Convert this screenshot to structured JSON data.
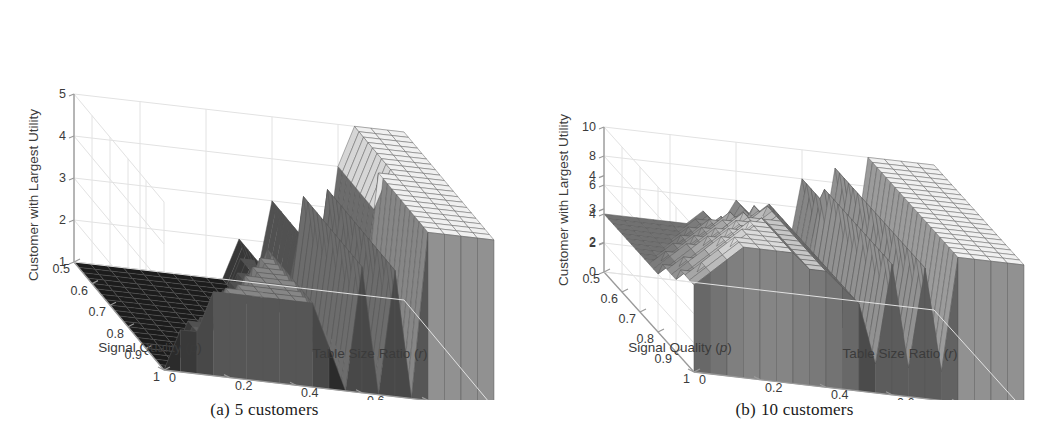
{
  "figure": {
    "background": "#ffffff",
    "panel_count": 2
  },
  "panels": [
    {
      "id": "panel-a",
      "caption_tag": "(a)",
      "caption_text": "5 customers",
      "chart_index": 0
    },
    {
      "id": "panel-b",
      "caption_tag": "(b)",
      "caption_text": "10 customers",
      "chart_index": 1
    }
  ],
  "chart_data": [
    {
      "type": "surface",
      "title": "",
      "subtitle": "(a) 5 customers",
      "xlabel": "Table Size Ratio (r)",
      "ylabel": "Signal Quality (p)",
      "zlabel": "Customer with Largest Utility",
      "xticks": [
        "1",
        "0.8",
        "0.6",
        "0.4",
        "0.2",
        "0"
      ],
      "xtick_values": [
        1,
        0.8,
        0.6,
        0.4,
        0.2,
        0
      ],
      "yticks": [
        "0.5",
        "0.6",
        "0.7",
        "0.8",
        "0.9",
        "1"
      ],
      "ytick_values": [
        0.5,
        0.6,
        0.7,
        0.8,
        0.9,
        1
      ],
      "zticks": [
        "1",
        "2",
        "3",
        "4",
        "5"
      ],
      "ztick_values": [
        1,
        2,
        3,
        4,
        5
      ],
      "xlim": [
        0,
        1
      ],
      "ylim": [
        0.5,
        1
      ],
      "zlim": [
        1,
        5
      ],
      "grid": true,
      "legend": "none",
      "colormap": "gray",
      "mesh": true,
      "n_customers": 5,
      "x": [
        1.0,
        0.95,
        0.9,
        0.85,
        0.8,
        0.75,
        0.7,
        0.65,
        0.6,
        0.55,
        0.5,
        0.45,
        0.4,
        0.35,
        0.3,
        0.25,
        0.2,
        0.15,
        0.1,
        0.05,
        0.0
      ],
      "y": [
        0.5,
        0.525,
        0.55,
        0.575,
        0.6,
        0.625,
        0.65,
        0.675,
        0.7,
        0.725,
        0.75,
        0.775,
        0.8,
        0.825,
        0.85,
        0.875,
        0.9,
        0.925,
        0.95,
        0.975,
        1.0
      ],
      "z": [
        [
          1,
          1,
          1,
          1,
          1,
          1,
          1,
          1,
          1,
          1,
          2,
          1,
          3,
          1,
          3,
          1,
          4,
          5,
          5,
          5,
          5
        ],
        [
          1,
          1,
          1,
          1,
          1,
          1,
          1,
          1,
          1,
          1,
          2,
          1,
          3,
          1,
          3,
          1,
          4,
          5,
          5,
          5,
          5
        ],
        [
          1,
          1,
          1,
          1,
          1,
          1,
          1,
          1,
          1,
          1,
          2,
          1,
          3,
          1,
          3,
          1,
          4,
          5,
          5,
          5,
          5
        ],
        [
          1,
          1,
          1,
          1,
          1,
          1,
          1,
          1,
          1,
          1,
          2,
          1,
          3,
          1,
          3,
          1,
          4,
          5,
          5,
          5,
          5
        ],
        [
          1,
          1,
          1,
          1,
          1,
          1,
          1,
          1,
          1,
          2,
          2,
          1,
          3,
          1,
          3,
          1,
          4,
          5,
          5,
          5,
          5
        ],
        [
          1,
          1,
          1,
          1,
          1,
          1,
          1,
          1,
          1,
          2,
          2,
          1,
          3,
          1,
          4,
          1,
          4,
          5,
          5,
          5,
          5
        ],
        [
          1,
          1,
          1,
          1,
          1,
          1,
          1,
          1,
          1,
          2,
          2,
          1,
          3,
          1,
          4,
          1,
          4,
          5,
          5,
          5,
          5
        ],
        [
          1,
          1,
          1,
          1,
          1,
          1,
          1,
          1,
          2,
          2,
          2,
          1,
          4,
          1,
          4,
          1,
          4,
          5,
          5,
          5,
          5
        ],
        [
          1,
          1,
          1,
          1,
          1,
          1,
          1,
          1,
          2,
          2,
          2,
          1,
          4,
          1,
          4,
          1,
          4,
          5,
          5,
          5,
          5
        ],
        [
          1,
          1,
          1,
          1,
          1,
          1,
          1,
          2,
          2,
          2,
          2,
          1,
          4,
          1,
          4,
          1,
          5,
          5,
          5,
          5,
          5
        ],
        [
          1,
          1,
          1,
          1,
          1,
          1,
          1,
          2,
          2,
          3,
          2,
          1,
          4,
          1,
          4,
          1,
          5,
          5,
          5,
          5,
          5
        ],
        [
          1,
          1,
          1,
          1,
          1,
          1,
          2,
          2,
          2,
          3,
          2,
          1,
          4,
          1,
          4,
          1,
          5,
          5,
          5,
          5,
          5
        ],
        [
          1,
          1,
          1,
          1,
          1,
          1,
          2,
          2,
          3,
          3,
          2,
          1,
          4,
          1,
          4,
          1,
          5,
          5,
          5,
          5,
          5
        ],
        [
          1,
          1,
          1,
          1,
          1,
          2,
          2,
          2,
          3,
          3,
          2,
          1,
          4,
          1,
          4,
          1,
          5,
          5,
          5,
          5,
          5
        ],
        [
          1,
          1,
          1,
          1,
          1,
          2,
          2,
          3,
          3,
          3,
          2,
          1,
          4,
          1,
          4,
          1,
          5,
          5,
          5,
          5,
          5
        ],
        [
          1,
          1,
          1,
          1,
          2,
          2,
          2,
          3,
          3,
          3,
          2,
          1,
          4,
          1,
          4,
          1,
          5,
          5,
          5,
          5,
          5
        ],
        [
          1,
          1,
          1,
          1,
          2,
          2,
          3,
          3,
          3,
          3,
          2,
          1,
          4,
          1,
          4,
          1,
          5,
          5,
          5,
          5,
          5
        ],
        [
          1,
          1,
          1,
          2,
          2,
          2,
          3,
          3,
          3,
          3,
          2,
          1,
          4,
          1,
          4,
          1,
          5,
          5,
          5,
          5,
          5
        ],
        [
          1,
          1,
          2,
          2,
          2,
          3,
          3,
          3,
          3,
          3,
          2,
          1,
          4,
          1,
          4,
          1,
          5,
          5,
          5,
          5,
          5
        ],
        [
          1,
          1,
          2,
          2,
          3,
          3,
          3,
          3,
          3,
          3,
          2,
          1,
          4,
          1,
          4,
          1,
          5,
          5,
          5,
          5,
          5
        ],
        [
          1,
          2,
          2,
          3,
          3,
          3,
          3,
          3,
          3,
          3,
          2,
          1,
          4,
          1,
          4,
          1,
          5,
          5,
          5,
          5,
          5
        ]
      ]
    },
    {
      "type": "surface",
      "title": "",
      "subtitle": "(b) 10 customers",
      "xlabel": "Table Size Ratio (r)",
      "ylabel": "Signal Quality (p)",
      "zlabel": "Customer with Largest Utility",
      "xticks": [
        "1",
        "0.8",
        "0.6",
        "0.4",
        "0.2",
        "0"
      ],
      "xtick_values": [
        1,
        0.8,
        0.6,
        0.4,
        0.2,
        0
      ],
      "yticks": [
        "0.5",
        "0.6",
        "0.7",
        "0.8",
        "0.9",
        "1"
      ],
      "ytick_values": [
        0.5,
        0.6,
        0.7,
        0.8,
        0.9,
        1
      ],
      "zticks": [
        "0",
        "2",
        "4",
        "6",
        "8",
        "10"
      ],
      "ztick_values": [
        0,
        2,
        4,
        6,
        8,
        10
      ],
      "zticks_overlay": [
        "2",
        "3",
        "4"
      ],
      "zticks_overlay_values": [
        2,
        3,
        4
      ],
      "xlim": [
        0,
        1
      ],
      "ylim": [
        0.5,
        1
      ],
      "zlim": [
        0,
        10
      ],
      "grid": true,
      "legend": "none",
      "colormap": "gray",
      "mesh": true,
      "n_customers": 10,
      "x": [
        1.0,
        0.95,
        0.9,
        0.85,
        0.8,
        0.75,
        0.7,
        0.65,
        0.6,
        0.55,
        0.5,
        0.45,
        0.4,
        0.35,
        0.3,
        0.25,
        0.2,
        0.15,
        0.1,
        0.05,
        0.0
      ],
      "y": [
        0.5,
        0.525,
        0.55,
        0.575,
        0.6,
        0.625,
        0.65,
        0.675,
        0.7,
        0.725,
        0.75,
        0.775,
        0.8,
        0.825,
        0.85,
        0.875,
        0.9,
        0.925,
        0.95,
        0.975,
        1.0
      ],
      "z": [
        [
          4,
          4,
          4,
          4,
          4,
          4,
          5,
          4,
          6,
          5,
          6,
          2,
          8,
          2,
          9,
          2,
          10,
          10,
          10,
          10,
          10
        ],
        [
          4,
          4,
          4,
          4,
          4,
          4,
          5,
          4,
          6,
          5,
          6,
          2,
          8,
          2,
          9,
          2,
          10,
          10,
          10,
          10,
          10
        ],
        [
          4,
          4,
          4,
          4,
          4,
          5,
          5,
          5,
          6,
          5,
          6,
          2,
          8,
          2,
          9,
          2,
          10,
          10,
          10,
          10,
          10
        ],
        [
          4,
          4,
          4,
          4,
          4,
          5,
          5,
          5,
          6,
          6,
          6,
          2,
          8,
          2,
          9,
          2,
          10,
          10,
          10,
          10,
          10
        ],
        [
          4,
          4,
          4,
          4,
          5,
          5,
          6,
          5,
          7,
          6,
          6,
          2,
          8,
          2,
          9,
          2,
          10,
          10,
          10,
          10,
          10
        ],
        [
          4,
          4,
          4,
          4,
          5,
          6,
          6,
          6,
          7,
          6,
          6,
          2,
          9,
          2,
          9,
          2,
          10,
          10,
          10,
          10,
          10
        ],
        [
          4,
          4,
          4,
          5,
          5,
          6,
          7,
          6,
          7,
          6,
          6,
          2,
          9,
          2,
          9,
          2,
          10,
          10,
          10,
          10,
          10
        ],
        [
          4,
          4,
          4,
          5,
          6,
          6,
          7,
          7,
          8,
          7,
          6,
          2,
          9,
          2,
          9,
          2,
          10,
          10,
          10,
          10,
          10
        ],
        [
          4,
          4,
          5,
          5,
          6,
          7,
          7,
          7,
          8,
          7,
          6,
          2,
          9,
          2,
          9,
          2,
          10,
          10,
          10,
          10,
          10
        ],
        [
          4,
          4,
          5,
          6,
          6,
          7,
          8,
          7,
          8,
          7,
          6,
          2,
          9,
          2,
          9,
          2,
          10,
          10,
          10,
          10,
          10
        ],
        [
          4,
          5,
          5,
          6,
          7,
          7,
          8,
          8,
          8,
          7,
          6,
          2,
          9,
          2,
          9,
          2,
          10,
          10,
          10,
          10,
          10
        ],
        [
          4,
          5,
          6,
          6,
          7,
          8,
          8,
          8,
          8,
          7,
          6,
          2,
          9,
          2,
          9,
          2,
          10,
          10,
          10,
          10,
          10
        ],
        [
          4,
          5,
          6,
          7,
          7,
          8,
          8,
          8,
          8,
          7,
          6,
          2,
          9,
          2,
          9,
          2,
          10,
          10,
          10,
          10,
          10
        ],
        [
          5,
          5,
          6,
          7,
          8,
          8,
          9,
          8,
          8,
          7,
          6,
          2,
          9,
          2,
          9,
          2,
          10,
          10,
          10,
          10,
          10
        ],
        [
          5,
          6,
          6,
          7,
          8,
          9,
          9,
          8,
          8,
          7,
          6,
          2,
          9,
          2,
          9,
          2,
          10,
          10,
          10,
          10,
          10
        ],
        [
          5,
          6,
          7,
          8,
          8,
          9,
          9,
          8,
          8,
          7,
          6,
          2,
          9,
          2,
          9,
          2,
          10,
          10,
          10,
          10,
          10
        ],
        [
          5,
          6,
          7,
          8,
          9,
          9,
          9,
          8,
          8,
          7,
          6,
          2,
          9,
          2,
          9,
          2,
          10,
          10,
          10,
          10,
          10
        ],
        [
          6,
          6,
          7,
          8,
          9,
          9,
          9,
          8,
          8,
          7,
          6,
          2,
          9,
          2,
          9,
          2,
          10,
          10,
          10,
          10,
          10
        ],
        [
          6,
          7,
          8,
          9,
          9,
          9,
          9,
          8,
          8,
          7,
          6,
          2,
          9,
          2,
          9,
          2,
          10,
          10,
          10,
          10,
          10
        ],
        [
          6,
          7,
          8,
          9,
          9,
          9,
          9,
          8,
          8,
          7,
          6,
          2,
          9,
          2,
          9,
          2,
          10,
          10,
          10,
          10,
          10
        ],
        [
          6,
          7,
          8,
          9,
          9,
          9,
          9,
          8,
          8,
          7,
          6,
          2,
          9,
          2,
          9,
          2,
          10,
          10,
          10,
          10,
          10
        ]
      ]
    }
  ],
  "colors": {
    "background": "#ffffff",
    "axis_line": "#9a9a9a",
    "grid_line": "#e2e2e2",
    "tick_text": "#3b3b3b",
    "mesh_line": "#555555",
    "surface_dark": "#2b2b2b",
    "surface_mid": "#8c8c8c",
    "surface_light": "#dcdcdc",
    "caption_text": "#1a1a1a"
  }
}
